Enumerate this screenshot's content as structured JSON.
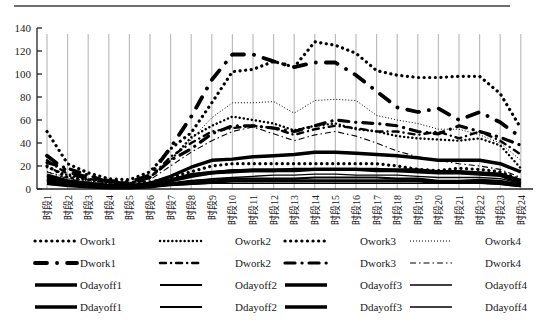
{
  "chart_data": {
    "type": "line",
    "title": "",
    "xlabel": "",
    "ylabel": "",
    "ylim": [
      0,
      140
    ],
    "yticks": [
      0,
      20,
      40,
      60,
      80,
      100,
      120,
      140
    ],
    "grid": {
      "vertical": true,
      "horizontal": false
    },
    "legend_position": "bottom",
    "categories": [
      "时段1",
      "时段2",
      "时段3",
      "时段4",
      "时段5",
      "时段6",
      "时段7",
      "时段8",
      "时段9",
      "时段10",
      "时段11",
      "时段12",
      "时段13",
      "时段14",
      "时段15",
      "时段16",
      "时段17",
      "时段18",
      "时段19",
      "时段20",
      "时段21",
      "时段22",
      "时段23",
      "时段24"
    ],
    "series": [
      {
        "name": "Owork1",
        "style": "bigdot",
        "values": [
          20,
          10,
          8,
          6,
          5,
          6,
          10,
          15,
          20,
          22,
          22,
          22,
          22,
          22,
          22,
          22,
          22,
          20,
          17,
          16,
          18,
          17,
          15,
          8
        ]
      },
      {
        "name": "Owork2",
        "style": "dot",
        "values": [
          19,
          12,
          8,
          5,
          5,
          10,
          25,
          45,
          55,
          63,
          60,
          57,
          51,
          55,
          57,
          52,
          50,
          46,
          44,
          43,
          42,
          44,
          38,
          18
        ]
      },
      {
        "name": "Owork3",
        "style": "bigdot",
        "values": [
          50,
          22,
          14,
          9,
          8,
          15,
          35,
          49,
          75,
          102,
          104,
          111,
          106,
          128,
          125,
          118,
          103,
          99,
          97,
          97,
          98,
          98,
          83,
          53
        ]
      },
      {
        "name": "Owork4",
        "style": "finedot",
        "values": [
          15,
          10,
          7,
          5,
          5,
          10,
          25,
          43,
          62,
          75,
          75,
          76,
          66,
          77,
          78,
          77,
          64,
          60,
          57,
          52,
          52,
          47,
          40,
          25
        ]
      },
      {
        "name": "Dwork1",
        "style": "longdashdot",
        "values": [
          29,
          15,
          10,
          7,
          6,
          12,
          36,
          63,
          95,
          117,
          117,
          111,
          106,
          110,
          110,
          99,
          85,
          71,
          67,
          70,
          60,
          67,
          58,
          45
        ]
      },
      {
        "name": "Dwork2",
        "style": "dashdot",
        "values": [
          25,
          13,
          9,
          6,
          5,
          10,
          28,
          40,
          50,
          53,
          55,
          53,
          47,
          52,
          55,
          53,
          50,
          50,
          47,
          50,
          44,
          50,
          42,
          30
        ]
      },
      {
        "name": "Dwork3",
        "style": "longdashdot2",
        "values": [
          23,
          18,
          12,
          6,
          5,
          10,
          25,
          35,
          48,
          55,
          55,
          53,
          50,
          55,
          60,
          58,
          57,
          55,
          50,
          48,
          55,
          50,
          45,
          38
        ]
      },
      {
        "name": "Dwork4",
        "style": "thindashdot",
        "values": [
          15,
          9,
          6,
          4,
          4,
          8,
          20,
          32,
          42,
          50,
          54,
          48,
          42,
          47,
          50,
          46,
          40,
          33,
          28,
          25,
          22,
          20,
          17,
          10
        ]
      },
      {
        "name": "Odayoff1",
        "style": "solid-thick",
        "values": [
          12,
          7,
          5,
          3,
          3,
          5,
          11,
          19,
          25,
          26,
          28,
          29,
          30,
          32,
          32,
          31,
          30,
          29,
          27,
          25,
          25,
          25,
          22,
          15
        ]
      },
      {
        "name": "Odayoff2",
        "style": "solid",
        "values": [
          10,
          6,
          4,
          3,
          2,
          4,
          8,
          13,
          15,
          16,
          17,
          17,
          17,
          17,
          17,
          17,
          17,
          17,
          17,
          15,
          15,
          14,
          13,
          8
        ]
      },
      {
        "name": "Odayoff3",
        "style": "solid-thick",
        "values": [
          8,
          5,
          3,
          2,
          2,
          3,
          7,
          11,
          14,
          15,
          16,
          16,
          16,
          17,
          17,
          17,
          16,
          16,
          15,
          14,
          14,
          13,
          12,
          5
        ]
      },
      {
        "name": "Odayoff4",
        "style": "solid-thin",
        "values": [
          7,
          4,
          3,
          2,
          2,
          3,
          5,
          7,
          9,
          10,
          11,
          12,
          12,
          13,
          13,
          12,
          12,
          12,
          11,
          10,
          10,
          10,
          9,
          5
        ]
      },
      {
        "name": "Ddayoff1",
        "style": "solid-thick",
        "values": [
          9,
          5,
          4,
          2,
          2,
          4,
          8,
          12,
          14,
          16,
          16,
          16,
          17,
          17,
          17,
          17,
          17,
          16,
          16,
          15,
          15,
          14,
          13,
          7
        ]
      },
      {
        "name": "Ddayoff2",
        "style": "solid",
        "values": [
          6,
          4,
          3,
          2,
          2,
          3,
          5,
          7,
          8,
          9,
          9,
          9,
          9,
          10,
          10,
          10,
          10,
          9,
          9,
          7,
          7,
          8,
          7,
          4
        ]
      },
      {
        "name": "Ddayoff3",
        "style": "solid-thick",
        "values": [
          5,
          3,
          2,
          1,
          1,
          2,
          4,
          5,
          6,
          7,
          7,
          7,
          7,
          7,
          7,
          7,
          7,
          7,
          7,
          6,
          6,
          6,
          5,
          3
        ]
      },
      {
        "name": "Ddayoff4",
        "style": "solid-thin",
        "values": [
          4,
          3,
          2,
          1,
          1,
          2,
          3,
          4,
          5,
          5,
          5,
          5,
          5,
          5,
          5,
          5,
          5,
          5,
          5,
          5,
          5,
          5,
          4,
          2
        ]
      }
    ]
  },
  "legend": {
    "rows": [
      [
        "Owork1",
        "Owork2",
        "Owork3",
        "Owork4"
      ],
      [
        "Dwork1",
        "Dwork2",
        "Dwork3",
        "Dwork4"
      ],
      [
        "Odayoff1",
        "Odayoff2",
        "Odayoff3",
        "Odayoff4"
      ],
      [
        "Ddayoff1",
        "Ddayoff2",
        "Ddayoff3",
        "Ddayoff4"
      ]
    ]
  },
  "colors": {
    "line": "#000000",
    "grid": "#bdbdbd",
    "axis": "#222222"
  }
}
